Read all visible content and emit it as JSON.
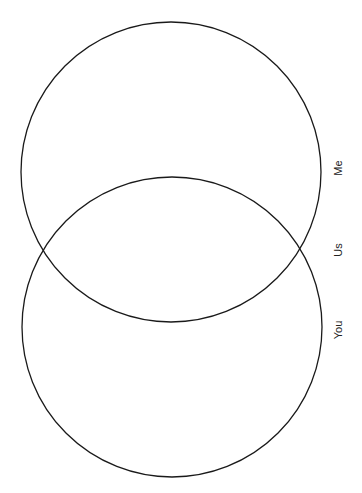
{
  "diagram": {
    "type": "venn",
    "sets": [
      {
        "id": "me",
        "label": "Me"
      },
      {
        "id": "you",
        "label": "You"
      }
    ],
    "intersection": {
      "label": "Us"
    },
    "colors": {
      "stroke": "#1a1a1a",
      "text": "#222222",
      "background": "#ffffff"
    }
  }
}
